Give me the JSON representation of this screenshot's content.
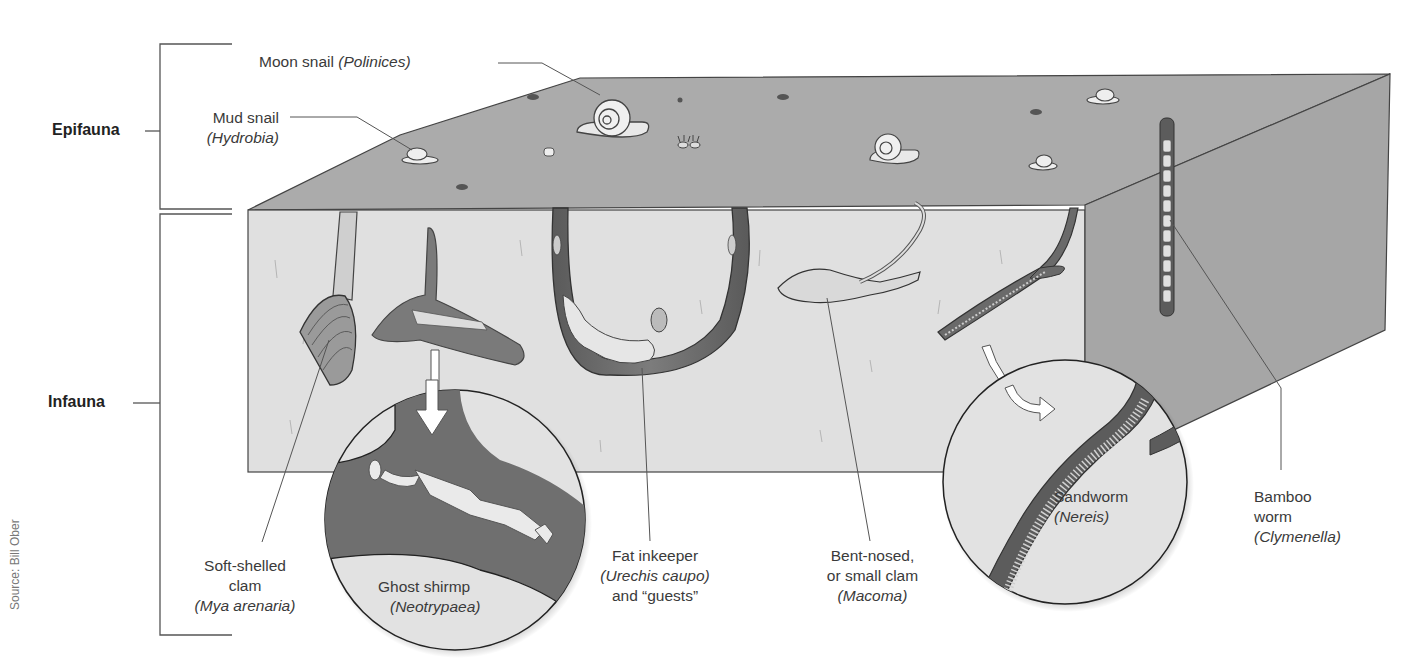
{
  "diagram": {
    "zones": [
      {
        "id": "epifauna",
        "label": "Epifauna"
      },
      {
        "id": "infauna",
        "label": "Infauna"
      }
    ],
    "labels": {
      "moon_snail": {
        "common": "Moon snail",
        "scientific": "(Polinices)"
      },
      "mud_snail": {
        "common": "Mud snail",
        "scientific": "(Hydrobia)"
      },
      "soft_shelled_clam": {
        "common_1": "Soft-shelled",
        "common_2": "clam",
        "scientific": "(Mya arenaria)"
      },
      "ghost_shrimp": {
        "common": "Ghost shirmp",
        "scientific": "(Neotrypaea)"
      },
      "fat_innkeeper": {
        "common": "Fat inkeeper",
        "scientific": "(Urechis caupo)",
        "extra": "and “guests”"
      },
      "bent_nosed_clam": {
        "common_1": "Bent-nosed,",
        "common_2": "or small clam",
        "scientific": "(Macoma)"
      },
      "sandworm": {
        "common": "Sandworm",
        "scientific": "(Nereis)"
      },
      "bamboo_worm": {
        "common_1": "Bamboo",
        "common_2": "worm",
        "scientific": "(Clymenella)"
      }
    },
    "source": "Source: Bill Ober",
    "colors": {
      "sediment_top": "#a9a9a9",
      "sediment_front": "#dedede",
      "sediment_side": "#a3a3a3",
      "burrow": "#6e6e6e",
      "line": "#555555",
      "text": "#3a3a3a"
    }
  }
}
